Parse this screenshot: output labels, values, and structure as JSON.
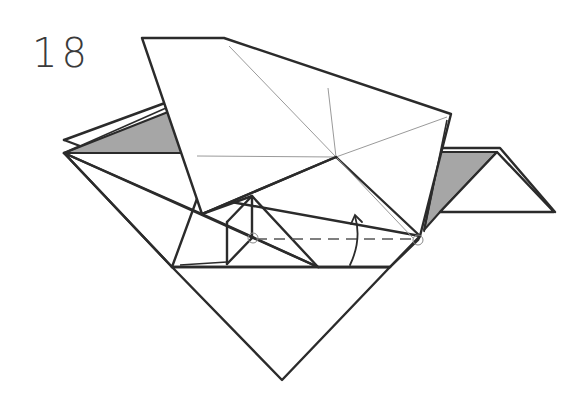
{
  "step": {
    "number": "18"
  },
  "diagram": {
    "colors": {
      "line": "#2b2b2b",
      "shade": "#a6a6a6",
      "crease": "#9a9a9a",
      "background": "#ffffff"
    },
    "symbols": {
      "fold_line": "valley-fold-dashed-line",
      "arrow": "fold-up-arrow",
      "pivots": [
        "pivot-circle-left",
        "pivot-circle-right"
      ]
    }
  }
}
